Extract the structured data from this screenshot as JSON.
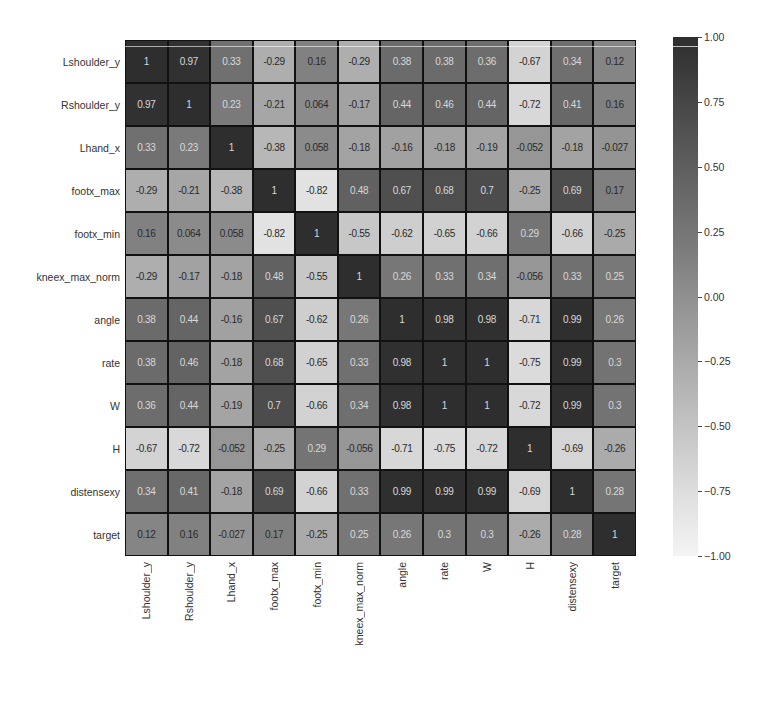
{
  "chart_data": {
    "type": "heatmap",
    "title": "",
    "xlabel": "",
    "ylabel": "",
    "colormap": "greys",
    "vmin": -1.0,
    "vmax": 1.0,
    "rows": [
      "Lshoulder_y",
      "Rshoulder_y",
      "Lhand_x",
      "footx_max",
      "footx_min",
      "kneex_max_norm",
      "angle",
      "rate",
      "W",
      "H",
      "distensexy",
      "target"
    ],
    "columns": [
      "Lshoulder_y",
      "Rshoulder_y",
      "Lhand_x",
      "footx_max",
      "footx_min",
      "kneex_max_norm",
      "angle",
      "rate",
      "W",
      "H",
      "distensexy",
      "target"
    ],
    "values": [
      [
        1,
        0.97,
        0.33,
        -0.29,
        0.16,
        -0.29,
        0.38,
        0.38,
        0.36,
        -0.67,
        0.34,
        0.12
      ],
      [
        0.97,
        1,
        0.23,
        -0.21,
        0.064,
        -0.17,
        0.44,
        0.46,
        0.44,
        -0.72,
        0.41,
        0.16
      ],
      [
        0.33,
        0.23,
        1,
        -0.38,
        0.058,
        -0.18,
        -0.16,
        -0.18,
        -0.19,
        -0.052,
        -0.18,
        -0.027
      ],
      [
        -0.29,
        -0.21,
        -0.38,
        1,
        -0.82,
        0.48,
        0.67,
        0.68,
        0.7,
        -0.25,
        0.69,
        0.17
      ],
      [
        0.16,
        0.064,
        0.058,
        -0.82,
        1,
        -0.55,
        -0.62,
        -0.65,
        -0.66,
        0.29,
        -0.66,
        -0.25
      ],
      [
        -0.29,
        -0.17,
        -0.18,
        0.48,
        -0.55,
        1,
        0.26,
        0.33,
        0.34,
        -0.056,
        0.33,
        0.25
      ],
      [
        0.38,
        0.44,
        -0.16,
        0.67,
        -0.62,
        0.26,
        1,
        0.98,
        0.98,
        -0.71,
        0.99,
        0.26
      ],
      [
        0.38,
        0.46,
        -0.18,
        0.68,
        -0.65,
        0.33,
        0.98,
        1,
        1,
        -0.75,
        0.99,
        0.3
      ],
      [
        0.36,
        0.44,
        -0.19,
        0.7,
        -0.66,
        0.34,
        0.98,
        1,
        1,
        -0.72,
        0.99,
        0.3
      ],
      [
        -0.67,
        -0.72,
        -0.052,
        -0.25,
        0.29,
        -0.056,
        -0.71,
        -0.75,
        -0.72,
        1,
        -0.69,
        -0.26
      ],
      [
        0.34,
        0.41,
        -0.18,
        0.69,
        -0.66,
        0.33,
        0.99,
        0.99,
        0.99,
        -0.69,
        1,
        0.28
      ],
      [
        0.12,
        0.16,
        -0.027,
        0.17,
        -0.25,
        0.25,
        0.26,
        0.3,
        0.3,
        -0.26,
        0.28,
        1
      ]
    ],
    "colorbar": {
      "ticks": [
        1.0,
        0.75,
        0.5,
        0.25,
        0.0,
        -0.25,
        -0.5,
        -0.75,
        -1.0
      ],
      "tick_labels": [
        "1.00",
        "0.75",
        "0.50",
        "0.25",
        "0.00",
        "−0.25",
        "−0.50",
        "−0.75",
        "−1.00"
      ]
    },
    "annot": true,
    "grid": true,
    "legend_position": "right (colorbar)"
  }
}
